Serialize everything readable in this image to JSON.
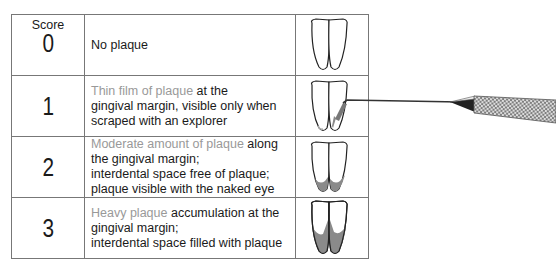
{
  "table": {
    "header_label": "Score",
    "rows": [
      {
        "score": "0",
        "highlight": "",
        "text": "No plaque"
      },
      {
        "score": "1",
        "highlight": "Thin film of plaque",
        "text_lines": [
          " at the",
          "gingival margin, visible only when",
          "scraped with an explorer"
        ]
      },
      {
        "score": "2",
        "highlight": "Moderate amount of plaque",
        "text_lines": [
          " along",
          "the gingival margin;",
          "interdental space free of plaque;",
          "plaque visible with the naked eye"
        ]
      },
      {
        "score": "3",
        "highlight": "Heavy plaque",
        "text_lines": [
          " accumulation at the",
          "gingival margin;",
          "interdental space filled with plaque"
        ]
      }
    ]
  },
  "icons": [
    "teeth-clean-icon",
    "teeth-thin-plaque-icon",
    "teeth-moderate-plaque-icon",
    "teeth-heavy-plaque-icon",
    "dental-explorer-probe-icon"
  ],
  "colors": {
    "highlight_text": "#999999",
    "plaque_fill": "#8a8a8a",
    "border": "#777777"
  }
}
